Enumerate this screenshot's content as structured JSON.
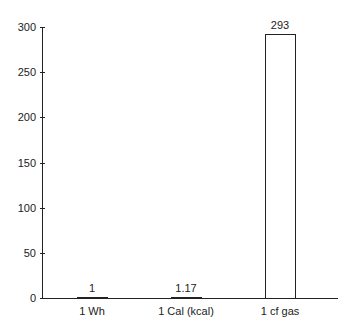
{
  "chart_data": {
    "type": "bar",
    "title": "",
    "xlabel": "",
    "ylabel": "",
    "categories": [
      "1 Wh",
      "1 Cal (kcal)",
      "1 cf gas"
    ],
    "values": [
      1,
      1.17,
      293
    ],
    "data_labels": [
      "1",
      "1.17",
      "293"
    ],
    "ylim": [
      0,
      300
    ],
    "yticks": [
      "0",
      "50",
      "100",
      "150",
      "200",
      "250",
      "300"
    ],
    "grid": false,
    "legend": null,
    "bar_fill": "#ffffff",
    "bar_edge": "#222222"
  }
}
